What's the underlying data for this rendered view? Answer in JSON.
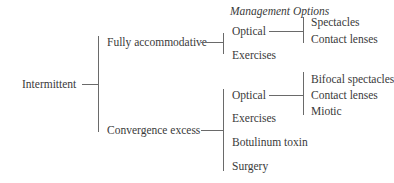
{
  "header": {
    "title": "Management Options"
  },
  "root": {
    "label": "Intermittent"
  },
  "branches": [
    {
      "label": "Fully accommodative",
      "options": [
        {
          "label": "Optical",
          "sub": [
            "Spectacles",
            "Contact lenses"
          ]
        },
        {
          "label": "Exercises"
        }
      ]
    },
    {
      "label": "Convergence excess",
      "options": [
        {
          "label": "Optical",
          "sub": [
            "Bifocal spectacles",
            "Contact lenses",
            "Miotic"
          ]
        },
        {
          "label": "Exercises"
        },
        {
          "label": "Botulinum toxin"
        },
        {
          "label": "Surgery"
        }
      ]
    }
  ],
  "colors": {
    "text": "#3a3a3a",
    "line": "#6a6a6a",
    "background": "#ffffff"
  }
}
